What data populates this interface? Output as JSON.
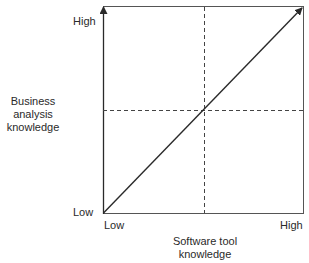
{
  "diagram": {
    "type": "2x2 quadrant diagram",
    "y_axis": {
      "label_lines": [
        "Business",
        "analysis",
        "knowledge"
      ],
      "high": "High",
      "low": "Low"
    },
    "x_axis": {
      "label_lines": [
        "Software tool",
        "knowledge"
      ],
      "low": "Low",
      "high": "High"
    },
    "line": "diagonal arrow from Low/Low to High/High",
    "dividers": "dashed midpoint lines (vertical and horizontal)",
    "colors": {
      "line": "#2a2a2a",
      "dashed": "#444444",
      "background": "#ffffff"
    }
  }
}
